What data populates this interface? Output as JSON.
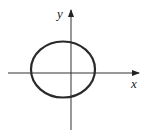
{
  "diagram": {
    "type": "ellipse-on-axes",
    "x_axis_label": "x",
    "y_axis_label": "y",
    "curve": "ellipse",
    "curve_color": "#2a2a2a",
    "axis_color": "#333333"
  }
}
